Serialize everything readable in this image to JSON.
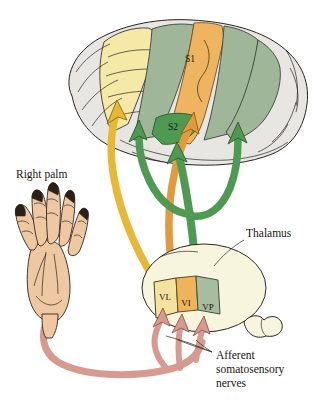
{
  "figure": {
    "background_color": "#ffffff"
  },
  "labels": {
    "right_palm": "Right palm",
    "thalamus": "Thalamus",
    "afferent_line1": "Afferent",
    "afferent_line2": "somatosensory",
    "afferent_line3": "nerves"
  },
  "cortex": {
    "regions": [
      {
        "id": "s1",
        "label": "S1",
        "color": "#edb259",
        "description": "primary somatosensory cortex strip"
      },
      {
        "id": "s2",
        "label": "S2",
        "color": "#4f9a52",
        "description": "secondary somatosensory cortex patch"
      }
    ],
    "strips": [
      {
        "id": "motor-strip",
        "label": "",
        "color": "#f5e7a3",
        "description": "pale yellow motor cortex strip"
      },
      {
        "id": "green-strip-anterior",
        "label": "",
        "color": "#9fb698",
        "description": "sage green gyrus anterior to S1"
      },
      {
        "id": "green-strip-posterior",
        "label": "",
        "color": "#9fb698",
        "description": "sage green gyrus posterior to S1"
      }
    ],
    "brain_outline_color": "#e6e4e0"
  },
  "thalamus": {
    "body_color": "#f7f4dd",
    "nuclei": [
      {
        "id": "vl",
        "label": "VL",
        "color": "#f3e2a0"
      },
      {
        "id": "vi",
        "label": "VI",
        "color": "#edb259"
      },
      {
        "id": "vp",
        "label": "VP",
        "color": "#a8bda0"
      }
    ]
  },
  "pathways": [
    {
      "id": "vl-tract",
      "color": "#e8b835",
      "from": "VL",
      "to": "motor-strip"
    },
    {
      "id": "vi-tract",
      "color": "#e39a3c",
      "from": "VI",
      "to": "S1"
    },
    {
      "id": "vp-tract",
      "color": "#4f9a52",
      "from": "VP",
      "to": "S2"
    }
  ],
  "hand": {
    "name": "right-palm",
    "skin_color": "#edc8a3",
    "nail_color": "#2b2017",
    "finger_count": 5
  },
  "nerves": {
    "color": "#d69a8f",
    "branch_count": 3,
    "description": "afferent somatosensory nerves from palm to thalamic nuclei"
  }
}
